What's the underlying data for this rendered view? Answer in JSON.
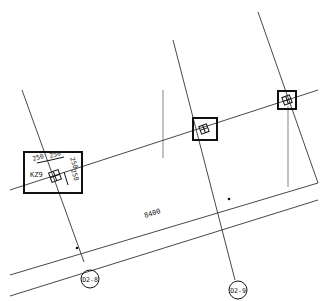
{
  "drawing": {
    "type": "structural column layout plan",
    "column_label": "KZ9",
    "column_dims": {
      "d1": "250",
      "d2": "250",
      "d3": "250",
      "d4": "250"
    },
    "span_dimension": "8400",
    "axis_labels": [
      "D2-8",
      "D2-9"
    ],
    "colors": {
      "line": "#333333",
      "gray_line": "#999999",
      "background": "#ffffff"
    }
  }
}
